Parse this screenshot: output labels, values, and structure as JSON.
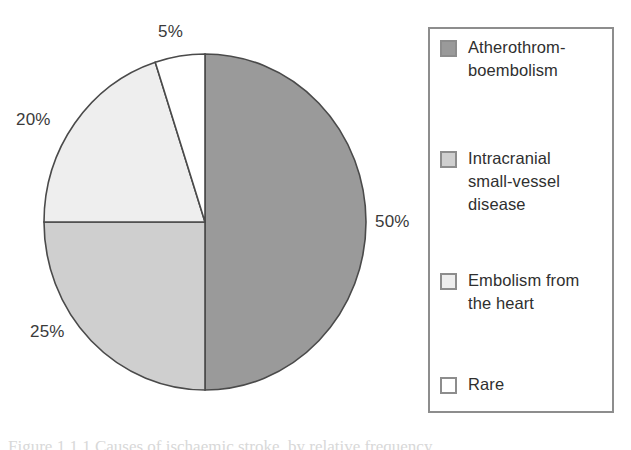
{
  "chart_data": {
    "type": "pie",
    "title": "",
    "subtitle": "",
    "xlabel": "",
    "ylabel": "",
    "unit": "%",
    "start_angle_deg": 0,
    "direction": "clockwise",
    "grid": false,
    "legend_position": "right",
    "categories": [
      "Atherothromboembolism",
      "Intracranial small-vessel disease",
      "Embolism from the heart",
      "Rare"
    ],
    "values": [
      50,
      25,
      20,
      5
    ],
    "data_labels": [
      "50%",
      "25%",
      "20%",
      "5%"
    ],
    "colors": [
      "#9a9a9a",
      "#cfcfcf",
      "#eeeeee",
      "#ffffff"
    ],
    "slice_outline_color": "#4a4a4a",
    "slices": [
      {
        "label": "Atherothromboembolism",
        "value": 50,
        "data_label": "50%",
        "color": "#9a9a9a",
        "start_angle_deg": 0,
        "end_angle_deg": 180,
        "label_position": "right"
      },
      {
        "label": "Intracranial small-vessel disease",
        "value": 25,
        "data_label": "25%",
        "color": "#cfcfcf",
        "start_angle_deg": 180,
        "end_angle_deg": 270,
        "label_position": "bottom-left"
      },
      {
        "label": "Embolism from the heart",
        "value": 20,
        "data_label": "20%",
        "color": "#eeeeee",
        "start_angle_deg": 270,
        "end_angle_deg": 342,
        "label_position": "left"
      },
      {
        "label": "Rare",
        "value": 5,
        "data_label": "5%",
        "color": "#ffffff",
        "start_angle_deg": 342,
        "end_angle_deg": 360,
        "label_position": "top"
      }
    ]
  },
  "labels": {
    "top": "5%",
    "left": "20%",
    "bottom": "25%",
    "right": "50%"
  },
  "legend": {
    "border_color": "#8d8d8d",
    "items": [
      {
        "swatch_name": "legend-swatch-atherothromboembolism",
        "color": "#9a9a9a",
        "label_line_1": "Atherothrom-",
        "label_line_2": "boembolism",
        "label_full": "Atherothromboembolism"
      },
      {
        "swatch_name": "legend-swatch-intracranial-small-vessel-disease",
        "color": "#cfcfcf",
        "label_line_1": "Intracranial",
        "label_line_2": "small-vessel",
        "label_line_3": "disease",
        "label_full": "Intracranial small-vessel disease"
      },
      {
        "swatch_name": "legend-swatch-embolism-from-the-heart",
        "color": "#eeeeee",
        "label_line_1": "Embolism from",
        "label_line_2": "the heart",
        "label_full": "Embolism from the heart"
      },
      {
        "swatch_name": "legend-swatch-rare",
        "color": "#ffffff",
        "label_line_1": "Rare",
        "label_full": "Rare"
      }
    ]
  },
  "caption": {
    "text": "Figure 1.1.1 Causes of ischaemic stroke, by relative frequency."
  }
}
